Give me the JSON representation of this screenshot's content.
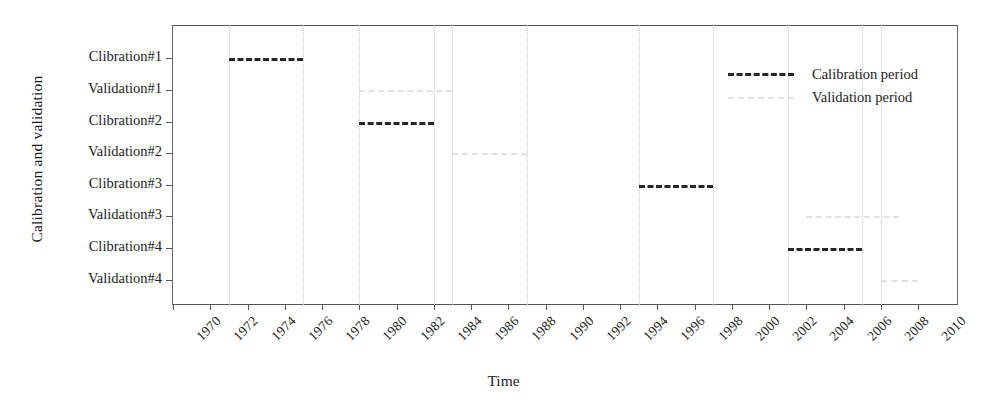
{
  "chart_data": {
    "type": "bar",
    "title": "",
    "xlabel": "Time",
    "ylabel": "Calibration and validation",
    "xlim": [
      1970,
      2010
    ],
    "ylim_categories": [
      "Clibration#1",
      "Validation#1",
      "Clibration#2",
      "Validation#2",
      "Clibration#3",
      "Validation#3",
      "Clibration#4",
      "Validation#4"
    ],
    "xticks": [
      "1970",
      "1972",
      "1974",
      "1976",
      "1978",
      "1980",
      "1982",
      "1984",
      "1986",
      "1988",
      "1990",
      "1992",
      "1994",
      "1996",
      "1998",
      "2000",
      "2002",
      "2004",
      "2006",
      "2008",
      "2010"
    ],
    "xtick_values": [
      1970,
      1972,
      1974,
      1976,
      1978,
      1980,
      1982,
      1984,
      1986,
      1988,
      1990,
      1992,
      1994,
      1996,
      1998,
      2000,
      2002,
      2004,
      2006,
      2008,
      2010
    ],
    "grid": "vertical-dotted",
    "legend_position": "top-center",
    "series": [
      {
        "name": "Calibration period",
        "kind": "calibration",
        "color": "#262626",
        "intervals": [
          {
            "row": "Clibration#1",
            "start": 1973,
            "end": 1977
          },
          {
            "row": "Clibration#2",
            "start": 1980,
            "end": 1984
          },
          {
            "row": "Clibration#3",
            "start": 1995,
            "end": 1999
          },
          {
            "row": "Clibration#4",
            "start": 2003,
            "end": 2007
          }
        ]
      },
      {
        "name": "Validation period",
        "kind": "validation",
        "color": "#e2e2e2",
        "intervals": [
          {
            "row": "Validation#1",
            "start": 1980,
            "end": 1985
          },
          {
            "row": "Validation#2",
            "start": 1985,
            "end": 1989
          },
          {
            "row": "Validation#3",
            "start": 2004,
            "end": 2009
          },
          {
            "row": "Validation#4",
            "start": 2008,
            "end": 2010
          }
        ]
      }
    ],
    "gridline_values": [
      1973,
      1977,
      1980,
      1984,
      1985,
      1989,
      1995,
      1999,
      2003,
      2007,
      2008
    ]
  },
  "legend": {
    "items": [
      {
        "label": "Calibration period",
        "kind": "calibration"
      },
      {
        "label": "Validation period",
        "kind": "validation"
      }
    ]
  },
  "axes": {
    "x_title": "Time",
    "y_title": "Calibration and validation"
  }
}
